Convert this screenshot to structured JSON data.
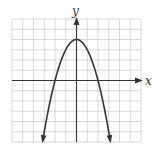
{
  "chart_data": {
    "type": "line",
    "title": "",
    "xlabel": "x",
    "ylabel": "y",
    "function": "y = 4 - x^2",
    "grid": true,
    "xlim": [
      -6,
      6
    ],
    "ylim": [
      -6,
      6
    ],
    "grid_step": 1,
    "series": [
      {
        "name": "parabola",
        "x": [
          -3.15,
          -3,
          -2.5,
          -2,
          -1.5,
          -1,
          -0.5,
          0,
          0.5,
          1,
          1.5,
          2,
          2.5,
          3,
          3.15
        ],
        "y": [
          -5.9,
          -5,
          -2.25,
          0,
          1.75,
          3,
          3.75,
          4,
          3.75,
          3,
          1.75,
          0,
          -2.25,
          -5,
          -5.9
        ]
      }
    ],
    "vertex": [
      0,
      4
    ],
    "x_intercepts": [
      -2,
      2
    ],
    "arrows": [
      "both-ends-down"
    ]
  },
  "labels": {
    "x_axis": "x",
    "y_axis": "y"
  },
  "colors": {
    "grid": "#c8c8c8",
    "axis": "#333333",
    "curve": "#333333"
  }
}
